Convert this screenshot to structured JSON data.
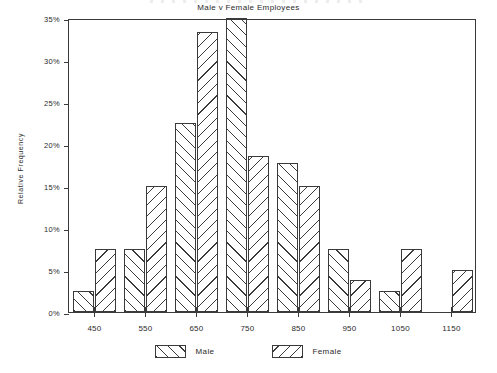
{
  "chart_data": {
    "type": "bar",
    "title": "Male v Female Employees",
    "xlabel": "",
    "ylabel": "Relative Frequency",
    "categories": [
      "450",
      "550",
      "650",
      "750",
      "850",
      "950",
      "1050",
      "1150"
    ],
    "series": [
      {
        "name": "Male",
        "hatch": "forward-slash",
        "values": [
          2.5,
          7.5,
          22.5,
          35.0,
          17.7,
          7.5,
          2.5,
          0.0
        ]
      },
      {
        "name": "Female",
        "hatch": "back-slash",
        "values": [
          7.5,
          15.0,
          33.3,
          18.6,
          15.0,
          3.8,
          7.5,
          5.0
        ]
      }
    ],
    "ylim": [
      0,
      35
    ],
    "yticks": [
      "0%",
      "5%",
      "10%",
      "15%",
      "20%",
      "25%",
      "30%",
      "35%"
    ],
    "ytick_values": [
      0,
      5,
      10,
      15,
      20,
      25,
      30,
      35
    ],
    "grid": false,
    "legend_position": "bottom-center",
    "value_format": "percent"
  },
  "legend": {
    "items": [
      {
        "label": "Male"
      },
      {
        "label": "Female"
      }
    ]
  },
  "colors": {
    "ink": "#3a3a3a",
    "text": "#2b2b2b",
    "background": "#ffffff"
  }
}
